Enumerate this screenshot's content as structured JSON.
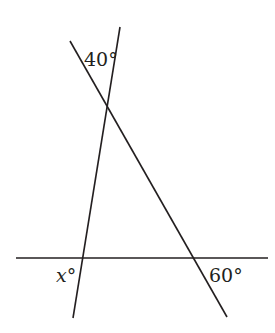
{
  "figure": {
    "type": "geometry",
    "stroke_color": "#231f20",
    "background": "#ffffff"
  },
  "lines": [
    {
      "id": "horizontal",
      "x1": 16,
      "y1": 258,
      "x2": 268,
      "y2": 258
    },
    {
      "id": "steep-transversal",
      "x1": 120,
      "y1": 27,
      "x2": 73,
      "y2": 318
    },
    {
      "id": "slanted-transversal",
      "x1": 70,
      "y1": 41,
      "x2": 227,
      "y2": 317
    }
  ],
  "labels": {
    "top_angle": {
      "text": "40°",
      "x": 84,
      "y": 66
    },
    "unknown_angle": {
      "var": "x",
      "degree": "°",
      "x": 56,
      "y": 282
    },
    "bottom_right_angle": {
      "text": "60°",
      "x": 209,
      "y": 282
    }
  }
}
